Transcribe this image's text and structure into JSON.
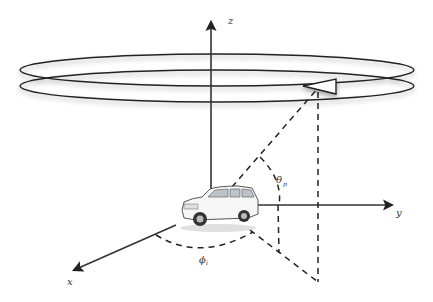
{
  "diagram": {
    "axes": {
      "x": "x",
      "y": "y",
      "z": "z"
    },
    "angles": {
      "elevation": {
        "symbol": "θ",
        "subscript": "p"
      },
      "azimuth": {
        "symbol": "ϕ",
        "subscript": "i"
      }
    },
    "objects": {
      "vehicle": "SUV car at origin",
      "satellite": "triangular transmitter on orbit ring",
      "orbits": 2
    }
  }
}
